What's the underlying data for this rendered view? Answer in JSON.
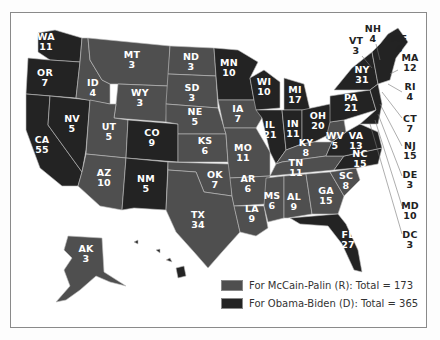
{
  "colors": {
    "mccain": "#4f4f4f",
    "obama": "#232323",
    "border": "#bdbdbd"
  },
  "legend": [
    {
      "key": "mccain",
      "label": "For McCain-Palin (R): Total = 173"
    },
    {
      "key": "obama",
      "label": "For Obama-Biden (D): Total = 365"
    }
  ],
  "states": [
    {
      "abbr": "WA",
      "votes": "11",
      "party": "obama",
      "x": 46,
      "y": 42
    },
    {
      "abbr": "OR",
      "votes": "7",
      "party": "obama",
      "x": 45,
      "y": 78
    },
    {
      "abbr": "CA",
      "votes": "55",
      "party": "obama",
      "x": 42,
      "y": 145
    },
    {
      "abbr": "NV",
      "votes": "5",
      "party": "obama",
      "x": 72,
      "y": 124
    },
    {
      "abbr": "ID",
      "votes": "4",
      "party": "mccain",
      "x": 93,
      "y": 88
    },
    {
      "abbr": "MT",
      "votes": "3",
      "party": "mccain",
      "x": 132,
      "y": 60
    },
    {
      "abbr": "WY",
      "votes": "3",
      "party": "mccain",
      "x": 140,
      "y": 98
    },
    {
      "abbr": "UT",
      "votes": "5",
      "party": "mccain",
      "x": 109,
      "y": 132
    },
    {
      "abbr": "CO",
      "votes": "9",
      "party": "obama",
      "x": 152,
      "y": 138
    },
    {
      "abbr": "AZ",
      "votes": "10",
      "party": "mccain",
      "x": 104,
      "y": 178
    },
    {
      "abbr": "NM",
      "votes": "5",
      "party": "obama",
      "x": 146,
      "y": 184
    },
    {
      "abbr": "ND",
      "votes": "3",
      "party": "mccain",
      "x": 191,
      "y": 62
    },
    {
      "abbr": "SD",
      "votes": "3",
      "party": "mccain",
      "x": 192,
      "y": 93
    },
    {
      "abbr": "NE",
      "votes": "5",
      "party": "mccain",
      "x": 195,
      "y": 117
    },
    {
      "abbr": "KS",
      "votes": "6",
      "party": "mccain",
      "x": 205,
      "y": 146
    },
    {
      "abbr": "OK",
      "votes": "7",
      "party": "mccain",
      "x": 215,
      "y": 180
    },
    {
      "abbr": "TX",
      "votes": "34",
      "party": "mccain",
      "x": 198,
      "y": 220
    },
    {
      "abbr": "MN",
      "votes": "10",
      "party": "obama",
      "x": 229,
      "y": 68
    },
    {
      "abbr": "IA",
      "votes": "7",
      "party": "mccain",
      "x": 238,
      "y": 114
    },
    {
      "abbr": "MO",
      "votes": "11",
      "party": "mccain",
      "x": 243,
      "y": 153
    },
    {
      "abbr": "AR",
      "votes": "6",
      "party": "mccain",
      "x": 248,
      "y": 184
    },
    {
      "abbr": "LA",
      "votes": "9",
      "party": "mccain",
      "x": 252,
      "y": 214
    },
    {
      "abbr": "WI",
      "votes": "10",
      "party": "obama",
      "x": 264,
      "y": 87
    },
    {
      "abbr": "IL",
      "votes": "21",
      "party": "obama",
      "x": 270,
      "y": 130
    },
    {
      "abbr": "MI",
      "votes": "17",
      "party": "obama",
      "x": 295,
      "y": 95
    },
    {
      "abbr": "IN",
      "votes": "11",
      "party": "obama",
      "x": 293,
      "y": 129
    },
    {
      "abbr": "OH",
      "votes": "20",
      "party": "obama",
      "x": 318,
      "y": 121
    },
    {
      "abbr": "KY",
      "votes": "8",
      "party": "mccain",
      "x": 306,
      "y": 148
    },
    {
      "abbr": "TN",
      "votes": "11",
      "party": "mccain",
      "x": 296,
      "y": 168
    },
    {
      "abbr": "MS",
      "votes": "6",
      "party": "mccain",
      "x": 272,
      "y": 201
    },
    {
      "abbr": "AL",
      "votes": "9",
      "party": "mccain",
      "x": 294,
      "y": 202
    },
    {
      "abbr": "GA",
      "votes": "15",
      "party": "mccain",
      "x": 326,
      "y": 196
    },
    {
      "abbr": "SC",
      "votes": "8",
      "party": "mccain",
      "x": 346,
      "y": 181
    },
    {
      "abbr": "FL",
      "votes": "27",
      "party": "obama",
      "x": 348,
      "y": 240
    },
    {
      "abbr": "NC",
      "votes": "15",
      "party": "obama",
      "x": 360,
      "y": 159
    },
    {
      "abbr": "VA",
      "votes": "13",
      "party": "obama",
      "x": 356,
      "y": 141
    },
    {
      "abbr": "WV",
      "votes": "5",
      "party": "mccain",
      "x": 335,
      "y": 141
    },
    {
      "abbr": "PA",
      "votes": "21",
      "party": "obama",
      "x": 351,
      "y": 103
    },
    {
      "abbr": "NY",
      "votes": "31",
      "party": "obama",
      "x": 362,
      "y": 75
    },
    {
      "abbr": "AK",
      "votes": "3",
      "party": "mccain",
      "x": 86,
      "y": 254
    },
    {
      "abbr": "HI",
      "votes": "4",
      "party": "obama",
      "x": 161,
      "y": 264
    }
  ],
  "outside_labels": [
    {
      "abbr": "NH",
      "votes": "4",
      "x": 373,
      "y": 34
    },
    {
      "abbr": "VT",
      "votes": "3",
      "x": 356,
      "y": 46
    },
    {
      "abbr": "ME",
      "votes": "4",
      "x": 399,
      "y": 44
    },
    {
      "abbr": "MA",
      "votes": "12",
      "x": 410,
      "y": 63
    },
    {
      "abbr": "RI",
      "votes": "4",
      "x": 410,
      "y": 92
    },
    {
      "abbr": "CT",
      "votes": "7",
      "x": 410,
      "y": 124
    },
    {
      "abbr": "NJ",
      "votes": "15",
      "x": 410,
      "y": 151
    },
    {
      "abbr": "DE",
      "votes": "3",
      "x": 410,
      "y": 180
    },
    {
      "abbr": "MD",
      "votes": "10",
      "x": 410,
      "y": 211
    },
    {
      "abbr": "DC",
      "votes": "3",
      "x": 410,
      "y": 240
    }
  ]
}
